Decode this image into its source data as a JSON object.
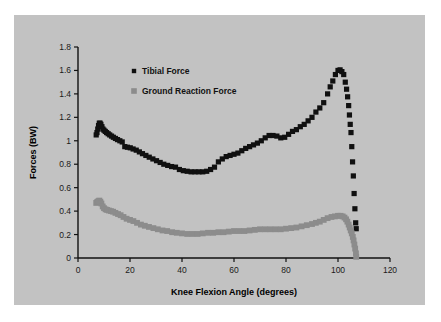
{
  "chart_data": {
    "type": "scatter",
    "title": "",
    "xlabel": "Knee Flexion Angle (degrees)",
    "ylabel": "Forces (BW)",
    "xlim": [
      0,
      120
    ],
    "ylim": [
      0,
      1.8
    ],
    "xticks": [
      0,
      20,
      40,
      60,
      80,
      100,
      120
    ],
    "xtick_labels": [
      "0",
      "20",
      "40",
      "60",
      "80",
      "100",
      "120"
    ],
    "yticks": [
      0,
      0.2,
      0.4,
      0.6,
      0.8,
      1,
      1.2,
      1.4,
      1.6,
      1.8
    ],
    "ytick_labels": [
      "0",
      "0.2",
      "0.4",
      "0.6",
      "0.8",
      "1",
      "1.2",
      "1.4",
      "1.6",
      "1.8"
    ],
    "grid": false,
    "legend_position": "upper-left-inside",
    "background_color": "#c2c2c2",
    "series": [
      {
        "name": "Tibial Force",
        "color": "#101010",
        "marker": "square",
        "marker_size": 2.6,
        "x": [
          7.0,
          7.3,
          7.6,
          7.9,
          8.2,
          8.5,
          8.8,
          9.2,
          9.6,
          10.0,
          10.5,
          11.0,
          11.6,
          12.2,
          12.9,
          13.6,
          14.4,
          15.2,
          16.1,
          17.0,
          18.0,
          19.0,
          20.1,
          21.2,
          22.4,
          23.6,
          24.8,
          26.1,
          27.4,
          28.8,
          30.2,
          31.6,
          33.0,
          34.5,
          36.0,
          37.5,
          39.0,
          40.5,
          42.0,
          43.5,
          45.0,
          46.5,
          48.0,
          49.5,
          51.0,
          52.5,
          54.0,
          55.5,
          57.0,
          58.5,
          60.0,
          61.5,
          63.0,
          64.5,
          66.0,
          67.5,
          69.0,
          70.5,
          72.0,
          73.5,
          75.0,
          76.5,
          78.0,
          79.5,
          81.0,
          82.5,
          84.0,
          85.5,
          87.0,
          88.5,
          90.0,
          91.5,
          93.0,
          94.5,
          96.0,
          97.0,
          98.0,
          99.0,
          100.0,
          100.8,
          101.5,
          102.2,
          102.8,
          103.3,
          103.7,
          104.1,
          104.4,
          104.7,
          105.0,
          105.3,
          105.6,
          105.9,
          106.2,
          106.5,
          106.8,
          107.0
        ],
        "y": [
          1.05,
          1.07,
          1.1,
          1.13,
          1.15,
          1.15,
          1.14,
          1.12,
          1.1,
          1.09,
          1.08,
          1.07,
          1.06,
          1.05,
          1.04,
          1.03,
          1.02,
          1.01,
          1.0,
          0.99,
          0.95,
          0.945,
          0.94,
          0.93,
          0.92,
          0.905,
          0.89,
          0.875,
          0.86,
          0.845,
          0.83,
          0.815,
          0.8,
          0.79,
          0.78,
          0.775,
          0.755,
          0.745,
          0.74,
          0.735,
          0.735,
          0.735,
          0.735,
          0.74,
          0.755,
          0.775,
          0.82,
          0.845,
          0.865,
          0.875,
          0.885,
          0.895,
          0.915,
          0.935,
          0.95,
          0.965,
          0.98,
          1.0,
          1.025,
          1.045,
          1.045,
          1.04,
          1.025,
          1.03,
          1.055,
          1.08,
          1.095,
          1.12,
          1.14,
          1.17,
          1.2,
          1.245,
          1.28,
          1.325,
          1.4,
          1.46,
          1.51,
          1.565,
          1.6,
          1.605,
          1.59,
          1.565,
          1.5,
          1.44,
          1.375,
          1.3,
          1.22,
          1.14,
          1.07,
          0.95,
          0.82,
          0.7,
          0.55,
          0.42,
          0.3,
          0.25
        ]
      },
      {
        "name": "Ground Reaction Force",
        "color": "#8c8c8c",
        "marker": "square",
        "marker_size": 2.9,
        "x": [
          7.0,
          7.3,
          7.6,
          7.9,
          8.2,
          8.6,
          9.0,
          9.5,
          10.0,
          10.6,
          11.2,
          11.9,
          12.7,
          13.5,
          14.4,
          15.4,
          16.4,
          17.5,
          18.7,
          20.0,
          21.3,
          22.7,
          24.2,
          25.7,
          27.3,
          29.0,
          30.7,
          32.5,
          34.3,
          36.2,
          38.0,
          40.0,
          42.0,
          44.0,
          46.0,
          48.0,
          50.0,
          52.0,
          54.0,
          56.0,
          58.0,
          60.0,
          62.0,
          64.0,
          66.0,
          68.0,
          70.0,
          72.0,
          74.0,
          76.0,
          78.0,
          80.0,
          82.0,
          84.0,
          86.0,
          88.0,
          90.0,
          91.5,
          93.0,
          94.5,
          96.0,
          97.5,
          98.8,
          100.0,
          101.0,
          101.8,
          102.5,
          103.1,
          103.6,
          104.1,
          104.5,
          104.9,
          105.3,
          105.7,
          106.0,
          106.3,
          106.6,
          106.9,
          107.0
        ],
        "y": [
          0.47,
          0.475,
          0.48,
          0.485,
          0.49,
          0.48,
          0.465,
          0.44,
          0.425,
          0.415,
          0.41,
          0.405,
          0.4,
          0.395,
          0.385,
          0.375,
          0.365,
          0.35,
          0.335,
          0.325,
          0.315,
          0.3,
          0.285,
          0.275,
          0.265,
          0.255,
          0.245,
          0.235,
          0.23,
          0.22,
          0.215,
          0.21,
          0.205,
          0.205,
          0.205,
          0.21,
          0.215,
          0.215,
          0.22,
          0.22,
          0.225,
          0.23,
          0.23,
          0.23,
          0.235,
          0.24,
          0.245,
          0.245,
          0.245,
          0.245,
          0.245,
          0.25,
          0.255,
          0.26,
          0.27,
          0.28,
          0.29,
          0.3,
          0.31,
          0.325,
          0.34,
          0.35,
          0.355,
          0.36,
          0.36,
          0.355,
          0.345,
          0.33,
          0.31,
          0.285,
          0.26,
          0.235,
          0.21,
          0.18,
          0.15,
          0.115,
          0.08,
          0.04,
          0.01
        ]
      }
    ]
  },
  "legend": {
    "items": [
      {
        "label": "Tibial Force",
        "color": "#101010"
      },
      {
        "label": "Ground Reaction Force",
        "color": "#8c8c8c"
      }
    ]
  }
}
